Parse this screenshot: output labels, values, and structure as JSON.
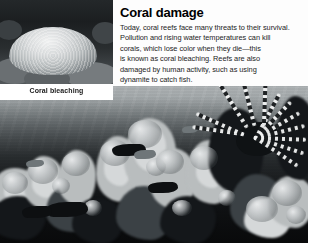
{
  "article": {
    "headline": "Coral damage",
    "body_lines": [
      "Today, coral reefs face many threats to their survival.",
      "Pollution and rising water temperatures can kill",
      "corals, which lose color when they die—this",
      "is known as coral bleaching. Reefs are also",
      "damaged by human activity, such as using",
      "dynamite to catch fish."
    ],
    "body_text": "Today, coral reefs face many threats to their survival. Pollution and rising water temperatures can kill corals, which lose color when they die—this is known as coral bleaching. Reefs are also damaged by human activity, such as using dynamite to catch fish."
  },
  "inset": {
    "caption": "Coral bleaching",
    "subject": "bleached-coral-head-photo"
  },
  "main_photo": {
    "subject": "underwater-coral-reef-scene",
    "features": [
      "lionfish",
      "reef-fish",
      "branching-corals",
      "open-water"
    ]
  },
  "colors": {
    "page_background": "#ffffff",
    "headline_text": "#000000",
    "body_text": "#1c1c1c",
    "caption_text": "#1a1a1a",
    "water_light": "#d8dadb",
    "water_dark": "#1e2224",
    "reef_shadow": "#0d0f11",
    "coral_highlight": "#e8eaeb"
  }
}
